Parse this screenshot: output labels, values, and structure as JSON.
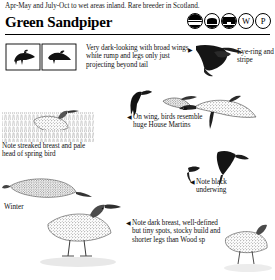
{
  "header": {
    "continuation_text": "Apr-May and July-Oct to wet areas inland. Rare breeder in Scotland.",
    "species_name": "Green Sandpiper",
    "status_icons": [
      {
        "name": "habitat-coast-icon",
        "label": ""
      },
      {
        "name": "habitat-estuary-icon",
        "label": ""
      },
      {
        "name": "habitat-woodland-icon",
        "label": ""
      },
      {
        "name": "season-winter-icon",
        "label": "W"
      },
      {
        "name": "season-passage-icon",
        "label": "P"
      }
    ]
  },
  "annotations": [
    {
      "id": "flight-profile",
      "text": "Very dark-looking with broad wings, white rump and legs only just projecting beyond tail",
      "marker": "right-arrow"
    },
    {
      "id": "head-detail",
      "text": "Eye-ring and stripe",
      "marker": "none"
    },
    {
      "id": "flight-comparison",
      "text": "On wing, birds resemble huge House Martins",
      "marker": "left-arrow"
    },
    {
      "id": "spring-plumage",
      "text": "Note streaked breast and pale head of spring bird",
      "marker": "none"
    },
    {
      "id": "underwing",
      "text": "Note black underwing",
      "marker": "left-arrow"
    },
    {
      "id": "standing-bird",
      "text": "Note dark breast, well-defined but tiny spots, stocky build and shorter legs than Wood sp",
      "marker": "left-arrow"
    }
  ],
  "plate_labels": {
    "winter": "Winter"
  },
  "figures": [
    {
      "name": "perched-bird-silhouette-left",
      "caption": ""
    },
    {
      "name": "perched-bird-silhouette-right",
      "caption": ""
    },
    {
      "name": "flying-bird-upper",
      "caption": ""
    },
    {
      "name": "flying-bird-head-detail",
      "caption": ""
    },
    {
      "name": "flying-bird-small-left",
      "caption": ""
    },
    {
      "name": "flying-bird-small-right",
      "caption": ""
    },
    {
      "name": "flying-bird-large-center",
      "caption": ""
    },
    {
      "name": "standing-bird-spring",
      "caption": ""
    },
    {
      "name": "standing-bird-winter",
      "caption": ""
    },
    {
      "name": "standing-bird-reeds",
      "caption": ""
    },
    {
      "name": "flying-bird-underwing",
      "caption": ""
    }
  ],
  "colors": {
    "ink": "#111111",
    "rule": "#000000",
    "paper": "#ffffff"
  }
}
